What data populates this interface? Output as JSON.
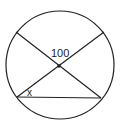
{
  "diagram": {
    "type": "circle-geometry",
    "labels": {
      "central_angle": "100",
      "inscribed_angle": "x"
    },
    "colors": {
      "stroke": "#222222",
      "background": "#ffffff"
    }
  }
}
